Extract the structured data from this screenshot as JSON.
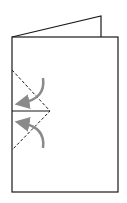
{
  "diagram": {
    "colors": {
      "outline": "#1a1a1a",
      "arrow": "#8a8a8a",
      "background": "#ffffff"
    },
    "shapes": {
      "back_panel": [
        [
          12,
          37
        ],
        [
          101,
          16
        ],
        [
          101,
          37
        ]
      ],
      "front_panel": {
        "x": 12,
        "y": 37,
        "width": 106,
        "height": 155
      },
      "fold_dashed": [
        [
          12,
          70
        ],
        [
          50,
          111
        ],
        [
          12,
          150
        ]
      ],
      "cut_line": [
        [
          12,
          111
        ],
        [
          50,
          111
        ]
      ]
    },
    "arrows": [
      {
        "name": "fold-arrow-upper",
        "direction": "down-left"
      },
      {
        "name": "fold-arrow-lower",
        "direction": "up-left"
      }
    ]
  }
}
